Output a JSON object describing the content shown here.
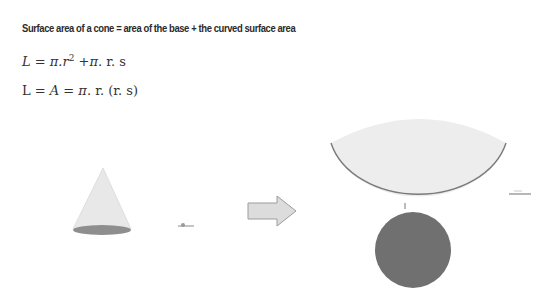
{
  "heading": "Surface area of a cone = area of the base + the curved surface area",
  "formulas": {
    "f1": {
      "lhs": "L",
      "eq": " = ",
      "pi1": "π",
      "rest1": ".r",
      "exp": "2",
      "plus": " +",
      "pi2": "π",
      "rest2": ". r. s"
    },
    "f2": {
      "lhs": "L = ",
      "A": "A",
      "eq": " = ",
      "pi": "π",
      "rest": ". r. (r. s)"
    }
  },
  "diagram": {
    "cone": {
      "fill": "#e6e6e6",
      "base_fill": "#8c8c8c"
    },
    "arrow": {
      "fill": "#d9d9d9",
      "stroke": "#9a9a9a"
    },
    "sector": {
      "fill": "#ececec",
      "stroke": "#7a7a7a"
    },
    "circle": {
      "fill": "#6e6e6e"
    },
    "small_labels": [
      "r",
      "s",
      "2πr"
    ]
  }
}
